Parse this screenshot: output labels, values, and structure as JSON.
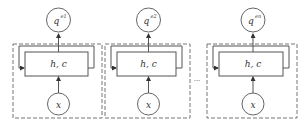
{
  "diagram": {
    "cells": [
      {
        "output_label": "q",
        "output_superscript": "e1",
        "state_label": "h, c",
        "input_label": "x"
      },
      {
        "output_label": "q",
        "output_superscript": "e2",
        "state_label": "h, c",
        "input_label": "x"
      },
      {
        "output_label": "q",
        "output_superscript": "en",
        "state_label": "h, c",
        "input_label": "x"
      }
    ],
    "ellipsis": "···",
    "colors": {
      "stroke": "#555555",
      "dashed": "#777777",
      "background": "#ffffff"
    }
  }
}
